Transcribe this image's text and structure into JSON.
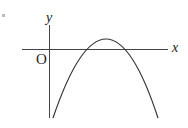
{
  "figure": {
    "type": "coordinate-plane-parabola",
    "labels": {
      "x_axis": "x",
      "y_axis": "y",
      "origin": "O"
    },
    "colors": {
      "stroke": "#333333",
      "background": "#ffffff"
    }
  }
}
